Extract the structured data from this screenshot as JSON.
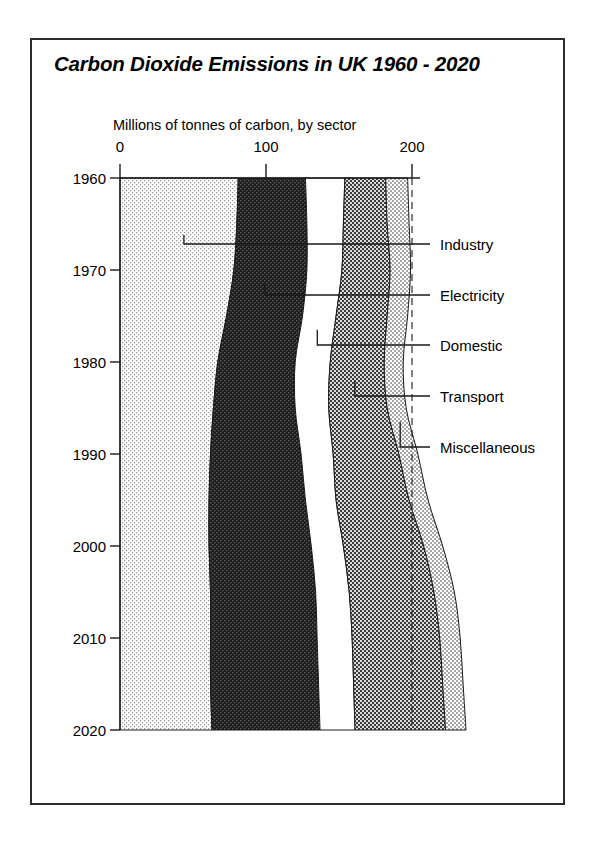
{
  "chart_title": "Carbon Dioxide Emissions in UK 1960 - 2020",
  "subtitle": "Millions of tonnes of carbon, by sector",
  "axis": {
    "x_ticks": [
      "0",
      "100",
      "200"
    ],
    "y_ticks": [
      "1960",
      "1970",
      "1980",
      "1990",
      "2000",
      "2010",
      "2020"
    ]
  },
  "legend": {
    "items": [
      {
        "label": "Industry"
      },
      {
        "label": "Electricity"
      },
      {
        "label": "Domestic"
      },
      {
        "label": "Transport"
      },
      {
        "label": "Miscellaneous"
      }
    ]
  },
  "chart_data": {
    "type": "area",
    "orientation": "horizontal-stacked",
    "title": "Carbon Dioxide Emissions in UK 1960 - 2020",
    "xlabel": "Millions of tonnes of carbon, by sector",
    "ylabel": "",
    "xlim": [
      0,
      200
    ],
    "ylim": [
      1960,
      2020
    ],
    "grid": true,
    "gridlines_x": [
      200
    ],
    "legend_position": "right-callout",
    "x": [
      1960,
      1965,
      1970,
      1975,
      1980,
      1985,
      1990,
      1995,
      2000,
      2005,
      2010,
      2015,
      2020
    ],
    "series": [
      {
        "name": "Industry",
        "values": [
          81,
          80,
          78,
          73,
          67,
          64,
          62,
          61,
          61,
          62,
          62,
          62,
          63
        ]
      },
      {
        "name": "Electricity",
        "values": [
          46,
          48,
          50,
          52,
          53,
          56,
          62,
          66,
          70,
          72,
          73,
          74,
          74
        ]
      },
      {
        "name": "Domestic",
        "values": [
          27,
          25,
          24,
          23,
          24,
          23,
          22,
          21,
          22,
          23,
          24,
          24,
          24
        ]
      },
      {
        "name": "Transport",
        "values": [
          28,
          30,
          33,
          35,
          37,
          40,
          45,
          50,
          55,
          58,
          60,
          61,
          62
        ]
      },
      {
        "name": "Miscellaneous",
        "values": [
          15,
          15,
          14,
          14,
          13,
          13,
          13,
          13,
          13,
          14,
          14,
          14,
          14
        ]
      }
    ],
    "totals": [
      197,
      198,
      199,
      197,
      194,
      196,
      204,
      211,
      221,
      229,
      233,
      235,
      237
    ]
  },
  "style": {
    "industry_fill": "#e8e8e8",
    "electricity_fill": "#2a2a2a",
    "domestic_fill": "#ffffff",
    "transport_fill": "#6e6e6e",
    "miscellaneous_fill": "#c4c4c4",
    "frame_color": "#2b2b2b"
  }
}
